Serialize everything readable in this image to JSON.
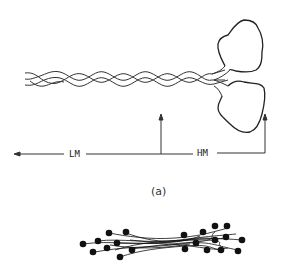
{
  "figure": {
    "caption": "(a)",
    "labels": {
      "lm": "LM",
      "hm": "HM"
    },
    "parts": [
      {
        "name": "rod-tail",
        "description": "coiled-coil twisted tail"
      },
      {
        "name": "head-upper",
        "description": "globular head"
      },
      {
        "name": "head-lower",
        "description": "globular head"
      },
      {
        "name": "filament",
        "description": "thick filament assembly with projecting heads"
      }
    ],
    "colors": {
      "line": "#222222",
      "background": "#ffffff"
    }
  }
}
